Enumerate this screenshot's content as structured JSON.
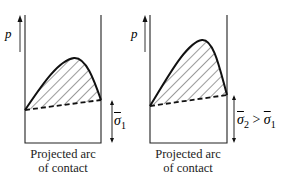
{
  "diagram": {
    "panels": [
      {
        "id": "left",
        "axis_label": "p",
        "sigma_label": "σ",
        "sigma_sub": "1",
        "sigma_relation": "",
        "caption_line1": "Projected arc",
        "caption_line2": "of contact"
      },
      {
        "id": "right",
        "axis_label": "p",
        "sigma_label": "σ",
        "sigma_sub": "2",
        "sigma_relation": " > ",
        "sigma_label_b": "σ",
        "sigma_sub_b": "1",
        "caption_line1": "Projected arc",
        "caption_line2": "of contact"
      }
    ],
    "colors": {
      "stroke": "#111111",
      "background": "#ffffff"
    }
  }
}
